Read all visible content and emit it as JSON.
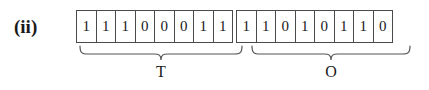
{
  "figure": {
    "label": "(ii)",
    "groups": [
      {
        "name": "T",
        "label": "T",
        "bits": [
          "1",
          "1",
          "1",
          "0",
          "0",
          "0",
          "1",
          "1"
        ]
      },
      {
        "name": "O",
        "label": "O",
        "bits": [
          "1",
          "1",
          "0",
          "1",
          "0",
          "1",
          "1",
          "0"
        ]
      }
    ],
    "colors": {
      "background": "#ffffff",
      "ink": "#1a1a1a",
      "cell_border": "#4a4a4a",
      "brace": "#555555"
    }
  }
}
